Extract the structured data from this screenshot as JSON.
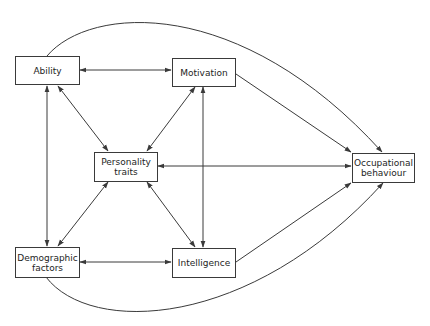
{
  "diagram": {
    "type": "path-diagram",
    "nodes": [
      {
        "id": "ability",
        "label": "Ability"
      },
      {
        "id": "motivation",
        "label": "Motivation"
      },
      {
        "id": "personality",
        "label_line1": "Personality",
        "label_line2": "traits"
      },
      {
        "id": "occupational",
        "label_line1": "Occupational",
        "label_line2": "behaviour"
      },
      {
        "id": "demographic",
        "label_line1": "Demographic",
        "label_line2": "factors"
      },
      {
        "id": "intelligence",
        "label": "Intelligence"
      }
    ],
    "edges": [
      {
        "from": "ability",
        "to": "motivation",
        "type": "bidirectional"
      },
      {
        "from": "ability",
        "to": "personality",
        "type": "bidirectional"
      },
      {
        "from": "ability",
        "to": "demographic",
        "type": "bidirectional"
      },
      {
        "from": "motivation",
        "to": "personality",
        "type": "bidirectional"
      },
      {
        "from": "motivation",
        "to": "intelligence",
        "type": "bidirectional"
      },
      {
        "from": "personality",
        "to": "occupational",
        "type": "bidirectional"
      },
      {
        "from": "personality",
        "to": "demographic",
        "type": "bidirectional"
      },
      {
        "from": "personality",
        "to": "intelligence",
        "type": "bidirectional"
      },
      {
        "from": "demographic",
        "to": "intelligence",
        "type": "bidirectional"
      },
      {
        "from": "motivation",
        "to": "occupational",
        "type": "directed"
      },
      {
        "from": "intelligence",
        "to": "occupational",
        "type": "directed"
      },
      {
        "from": "ability",
        "to": "occupational",
        "type": "directed-curved"
      },
      {
        "from": "demographic",
        "to": "occupational",
        "type": "directed-curved"
      }
    ],
    "colors": {
      "line": "#3a3a3a",
      "text": "#1e1e1e",
      "background": "#ffffff"
    }
  }
}
